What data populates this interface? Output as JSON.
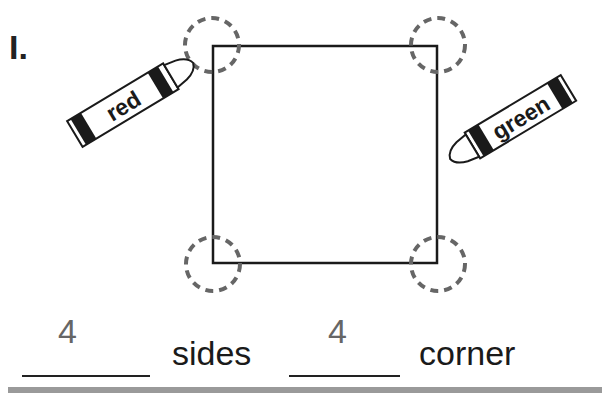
{
  "problem": {
    "number": "I.",
    "shape": "square",
    "crayons": [
      {
        "label": "red",
        "position": "top-left"
      },
      {
        "label": "green",
        "position": "right"
      }
    ],
    "corner_markers": 4,
    "answers": [
      {
        "value": "4",
        "label": "sides"
      },
      {
        "value": "4",
        "label": "corner"
      }
    ]
  },
  "colors": {
    "outline": "#1a1a1a",
    "dashed_circle": "#666666",
    "rule": "#9a9a9a"
  }
}
